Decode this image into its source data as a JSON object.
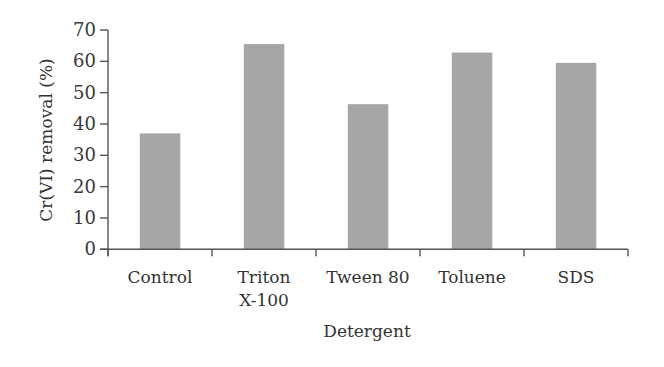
{
  "chart_data": {
    "type": "bar",
    "title": "",
    "xlabel": "Detergent",
    "ylabel": "Cr(VI) removal (%)",
    "categories": [
      "Control",
      "Triton X-100",
      "Tween 80",
      "Toluene",
      "SDS"
    ],
    "category_label_lines": [
      [
        "Control"
      ],
      [
        "Triton",
        "X-100"
      ],
      [
        "Tween 80"
      ],
      [
        "Toluene"
      ],
      [
        "SDS"
      ]
    ],
    "values": [
      37,
      65.5,
      46.3,
      62.8,
      59.5
    ],
    "ylim": [
      0,
      70
    ],
    "yticks": [
      0,
      10,
      20,
      30,
      40,
      50,
      60,
      70
    ],
    "grid": false,
    "legend": null,
    "bar_color": "#a6a6a6"
  }
}
